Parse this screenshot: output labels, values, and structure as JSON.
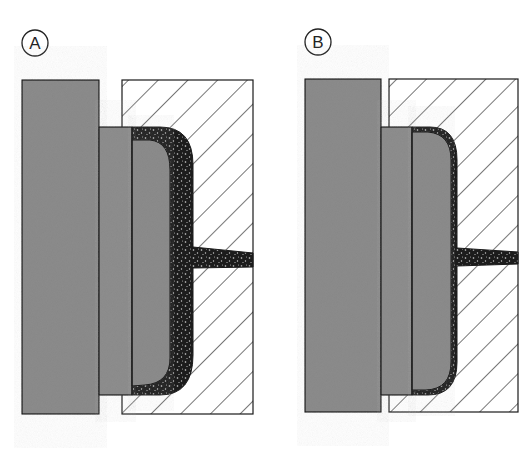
{
  "diagram": {
    "type": "cross-section",
    "panels": [
      {
        "id": "A",
        "label": "A",
        "description": "Thick molded layer between core and hatched mold half, with sprue channel"
      },
      {
        "id": "B",
        "label": "B",
        "description": "Thin molded layer between core and hatched mold half, with sprue channel"
      }
    ],
    "colors": {
      "plate_fill": "#8c8c8c",
      "outline": "#1a1a1a",
      "hatch_line": "#1a1a1a",
      "molded_material": "#1c1c1c",
      "background": "#ffffff"
    }
  }
}
